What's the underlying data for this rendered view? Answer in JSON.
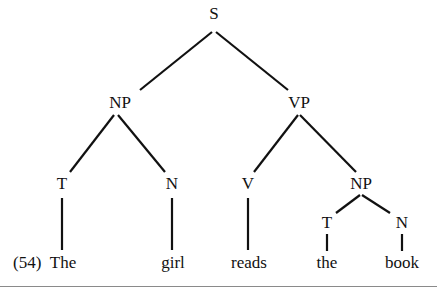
{
  "example_number": "(54)",
  "nodes": {
    "s": {
      "label": "S",
      "x": 214,
      "y": 4
    },
    "np_subject": {
      "label": "NP",
      "x": 120,
      "y": 94
    },
    "vp": {
      "label": "VP",
      "x": 299,
      "y": 94
    },
    "t_subject": {
      "label": "T",
      "x": 63,
      "y": 175
    },
    "n_subject": {
      "label": "N",
      "x": 173,
      "y": 175
    },
    "v": {
      "label": "V",
      "x": 249,
      "y": 175
    },
    "np_object": {
      "label": "NP",
      "x": 361,
      "y": 175
    },
    "t_object": {
      "label": "T",
      "x": 327,
      "y": 214
    },
    "n_object": {
      "label": "N",
      "x": 402,
      "y": 214
    }
  },
  "leaves": {
    "the_subject": {
      "label": "The",
      "x": 63,
      "y": 254
    },
    "girl": {
      "label": "girl",
      "x": 173,
      "y": 254
    },
    "reads": {
      "label": "reads",
      "x": 249,
      "y": 254
    },
    "the_object": {
      "label": "the",
      "x": 327,
      "y": 254
    },
    "book": {
      "label": "book",
      "x": 402,
      "y": 254
    }
  },
  "sentence": "The girl reads the book",
  "colors": {
    "ink": "#111111",
    "rule": "#8a8a8a",
    "background": "#ffffff"
  }
}
